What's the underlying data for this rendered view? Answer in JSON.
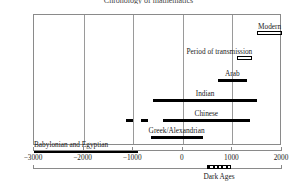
{
  "chart_data": {
    "type": "bar",
    "orientation": "horizontal-timeline",
    "title": "Chronology of mathematics",
    "xlabel": "",
    "ylabel": "",
    "xlim": [
      -3000,
      2000
    ],
    "xticks": [
      -3000,
      -2000,
      -1000,
      0,
      1000,
      2000
    ],
    "xticklabels": [
      "−3000",
      "−2000",
      "−1000",
      "0",
      "1000",
      "2000"
    ],
    "grid": true,
    "legend": "none",
    "categories": [
      "Modern",
      "Period of transmission",
      "Arab",
      "Indian",
      "Chinese",
      "Greek/Alexandrian",
      "Babylonian and Egyptian"
    ],
    "series": [
      {
        "name": "Modern",
        "label": "Modern",
        "start": 1500,
        "end": 2000,
        "style": "hollow",
        "label_align": "center",
        "segments": []
      },
      {
        "name": "Period of transmission",
        "label": "Period of transmission",
        "start": 1100,
        "end": 1400,
        "style": "hollow",
        "label_align": "right",
        "segments": []
      },
      {
        "name": "Arab",
        "label": "Arab",
        "start": 700,
        "end": 1300,
        "style": "solid",
        "label_align": "center",
        "segments": []
      },
      {
        "name": "Indian",
        "label": "Indian",
        "start": -600,
        "end": 1500,
        "style": "solid",
        "label_align": "center",
        "segments": []
      },
      {
        "name": "Chinese",
        "label": "Chinese",
        "start": -400,
        "end": 1350,
        "style": "solid",
        "label_align": "center",
        "segments": [
          {
            "start": -1150,
            "end": -1000
          },
          {
            "start": -850,
            "end": -700
          }
        ]
      },
      {
        "name": "Greek/Alexandrian",
        "label": "Greek/Alexandrian",
        "start": -650,
        "end": 400,
        "style": "solid",
        "label_align": "center",
        "segments": []
      },
      {
        "name": "Babylonian and Egyptian",
        "label": "Babylonian and Egyptian",
        "start": -3000,
        "end": -900,
        "style": "solid",
        "label_align": "left",
        "segments": []
      }
    ],
    "annotations": [
      {
        "name": "dark-ages",
        "label": "Dark Ages",
        "start": 500,
        "end": 1000,
        "style": "hatched",
        "axis": "secondary"
      }
    ]
  }
}
